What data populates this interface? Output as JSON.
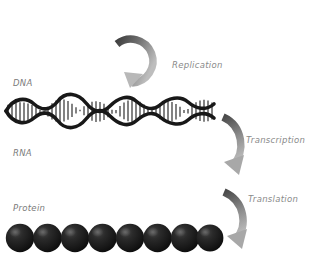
{
  "diagram": {
    "background_color": "#ffffff",
    "molecule_color": "#1a1a1a",
    "arrow_color_dark": "#4a4a4a",
    "arrow_color_light": "#b5b5b5",
    "label_color": "#7b7b7b"
  },
  "stages": [
    {
      "id": "dna",
      "label": "DNA"
    },
    {
      "id": "rna",
      "label": "RNA"
    },
    {
      "id": "protein",
      "label": "Protein"
    }
  ],
  "processes": [
    {
      "id": "replication",
      "label": "Replication"
    },
    {
      "id": "transcription",
      "label": "Transcription"
    },
    {
      "id": "translation",
      "label": "Translation"
    }
  ],
  "molecules": {
    "dna": {
      "type": "double-helix",
      "wave_count": 3.5,
      "rung_count": 44,
      "x_start": 6,
      "x_end": 214,
      "center_y": 111,
      "amplitude": 13
    },
    "rna": {
      "type": "single-strand",
      "tick_count": 62,
      "x_start": 6,
      "x_end": 212,
      "baseline_y": 186,
      "tick_height": 13
    },
    "protein": {
      "type": "bead-chain",
      "bead_count": 8,
      "bead_radius": 14,
      "x_start": 6,
      "center_y": 238
    }
  }
}
